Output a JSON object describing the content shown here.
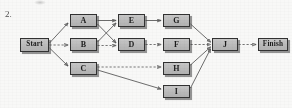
{
  "question": {
    "number": "2."
  },
  "diagram": {
    "type": "project-network-diagram",
    "title": "",
    "nodes": [
      {
        "id": "start",
        "label": "Start",
        "x": 20,
        "y": 38,
        "w": 29,
        "h": 14
      },
      {
        "id": "A",
        "label": "A",
        "x": 70,
        "y": 14,
        "w": 27,
        "h": 13
      },
      {
        "id": "B",
        "label": "B",
        "x": 70,
        "y": 38,
        "w": 27,
        "h": 13
      },
      {
        "id": "C",
        "label": "C",
        "x": 70,
        "y": 62,
        "w": 27,
        "h": 13
      },
      {
        "id": "E",
        "label": "E",
        "x": 118,
        "y": 14,
        "w": 27,
        "h": 13
      },
      {
        "id": "D",
        "label": "D",
        "x": 118,
        "y": 38,
        "w": 27,
        "h": 13
      },
      {
        "id": "G",
        "label": "G",
        "x": 163,
        "y": 14,
        "w": 27,
        "h": 13
      },
      {
        "id": "F",
        "label": "F",
        "x": 163,
        "y": 38,
        "w": 27,
        "h": 13
      },
      {
        "id": "H",
        "label": "H",
        "x": 163,
        "y": 62,
        "w": 27,
        "h": 13
      },
      {
        "id": "I",
        "label": "I",
        "x": 163,
        "y": 85,
        "w": 27,
        "h": 13
      },
      {
        "id": "J",
        "label": "J",
        "x": 212,
        "y": 38,
        "w": 26,
        "h": 13
      },
      {
        "id": "finish",
        "label": "Finish",
        "x": 258,
        "y": 38,
        "w": 30,
        "h": 13
      }
    ],
    "edges": [
      {
        "from": "start",
        "to": "A",
        "style": "solid"
      },
      {
        "from": "start",
        "to": "B",
        "style": "dashed"
      },
      {
        "from": "start",
        "to": "C",
        "style": "solid"
      },
      {
        "from": "A",
        "to": "E",
        "style": "solid"
      },
      {
        "from": "A",
        "to": "D",
        "style": "solid"
      },
      {
        "from": "B",
        "to": "E",
        "style": "solid"
      },
      {
        "from": "B",
        "to": "D",
        "style": "dashed"
      },
      {
        "from": "C",
        "to": "H",
        "style": "dashed"
      },
      {
        "from": "C",
        "to": "I",
        "style": "solid"
      },
      {
        "from": "E",
        "to": "G",
        "style": "solid"
      },
      {
        "from": "D",
        "to": "F",
        "style": "dashed"
      },
      {
        "from": "G",
        "to": "J",
        "style": "solid"
      },
      {
        "from": "F",
        "to": "J",
        "style": "dashed"
      },
      {
        "from": "H",
        "to": "J",
        "style": "solid"
      },
      {
        "from": "I",
        "to": "J",
        "style": "solid"
      },
      {
        "from": "J",
        "to": "finish",
        "style": "dashed"
      }
    ],
    "colors": {
      "node_fill": "#bfbfbf",
      "node_border": "#2c2c2c",
      "edge": "#4f4f4f",
      "background": "#fdfdfc"
    }
  }
}
